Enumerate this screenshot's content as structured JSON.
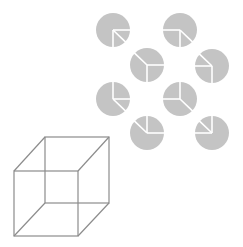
{
  "figure": {
    "title": "",
    "colors": {
      "background": "#ffffff",
      "disc": "#c4c4c4",
      "disc_line": "#ffffff",
      "cube_line": "#8c8c8c"
    },
    "disc_radius": 17,
    "discs": [
      {
        "cx": 113,
        "cy": 30,
        "segments": [
          "down",
          "right",
          "down-right"
        ]
      },
      {
        "cx": 180,
        "cy": 30,
        "segments": [
          "down",
          "left",
          "down-right"
        ]
      },
      {
        "cx": 147,
        "cy": 65,
        "segments": [
          "down",
          "right",
          "up-left"
        ]
      },
      {
        "cx": 212,
        "cy": 66,
        "segments": [
          "down",
          "left",
          "up-left"
        ]
      },
      {
        "cx": 113,
        "cy": 99,
        "segments": [
          "up",
          "right",
          "down-right"
        ]
      },
      {
        "cx": 180,
        "cy": 99,
        "segments": [
          "up",
          "left",
          "down-right"
        ]
      },
      {
        "cx": 147,
        "cy": 133,
        "segments": [
          "up",
          "right",
          "up-left"
        ]
      },
      {
        "cx": 212,
        "cy": 133,
        "segments": [
          "up",
          "left",
          "up-left"
        ]
      }
    ],
    "necker_cube": {
      "front": {
        "x1": 14,
        "y1": 171,
        "x2": 78,
        "y2": 236
      },
      "back": {
        "x1": 45,
        "y1": 137,
        "x2": 109,
        "y2": 203
      }
    }
  }
}
